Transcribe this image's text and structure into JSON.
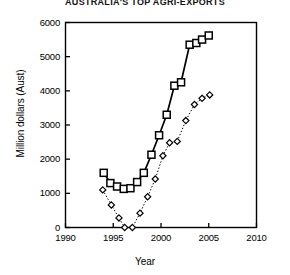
{
  "chart_data": {
    "type": "line",
    "title": "AUSTRALIA'S TOP AGRI-EXPORTS",
    "xlabel": "Year",
    "ylabel": "Million dollars (Aust)",
    "xlim": [
      1990,
      2010
    ],
    "ylim": [
      0,
      6000
    ],
    "xticks": [
      1990,
      1995,
      2000,
      2005,
      2010
    ],
    "yticks": [
      0,
      1000,
      2000,
      3000,
      4000,
      5000,
      6000
    ],
    "grid": false,
    "legend": "none",
    "series": [
      {
        "name": "series-squares",
        "marker": "square",
        "linestyle": "solid",
        "color": "#000000",
        "points": [
          [
            1994.0,
            1600
          ],
          [
            1994.7,
            1300
          ],
          [
            1995.4,
            1200
          ],
          [
            1996.1,
            1130
          ],
          [
            1996.8,
            1150
          ],
          [
            1997.5,
            1330
          ],
          [
            1998.2,
            1600
          ],
          [
            1999.0,
            2130
          ],
          [
            1999.8,
            2700
          ],
          [
            2000.6,
            3300
          ],
          [
            2001.4,
            4150
          ],
          [
            2002.1,
            4250
          ],
          [
            2003.0,
            5350
          ],
          [
            2003.7,
            5400
          ],
          [
            2004.3,
            5500
          ],
          [
            2005.0,
            5620
          ]
        ]
      },
      {
        "name": "series-diamonds",
        "marker": "diamond",
        "linestyle": "dotted",
        "color": "#000000",
        "points": [
          [
            1993.9,
            1100
          ],
          [
            1994.8,
            660
          ],
          [
            1995.6,
            280
          ],
          [
            1996.2,
            0
          ],
          [
            1997.0,
            0
          ],
          [
            1997.8,
            420
          ],
          [
            1998.6,
            900
          ],
          [
            1999.4,
            1420
          ],
          [
            2000.2,
            2100
          ],
          [
            2000.9,
            2480
          ],
          [
            2001.7,
            2520
          ],
          [
            2002.6,
            3130
          ],
          [
            2003.5,
            3600
          ],
          [
            2004.3,
            3780
          ],
          [
            2005.1,
            3880
          ]
        ]
      }
    ]
  }
}
